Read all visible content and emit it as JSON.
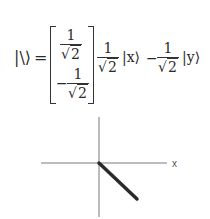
{
  "equation": {
    "lhs": "|\\⟩",
    "equals": "=",
    "matrix": {
      "top": {
        "sign": "",
        "numerator": "1",
        "denominator": "2"
      },
      "bottom": {
        "sign": "−",
        "numerator": "1",
        "denominator": "2"
      }
    },
    "rhs": {
      "term1": {
        "numerator": "1",
        "denominator": "2",
        "ket": "|x⟩"
      },
      "minus": "−",
      "term2": {
        "numerator": "1",
        "denominator": "2",
        "ket": "|y⟩"
      }
    },
    "radical_symbol": "√"
  },
  "diagram": {
    "x_axis_label": "x",
    "origin": [
      99,
      163
    ],
    "vector_end": [
      137,
      199
    ],
    "axis_color": "#7a7a7a",
    "vector_color": "#2a2a2a"
  }
}
